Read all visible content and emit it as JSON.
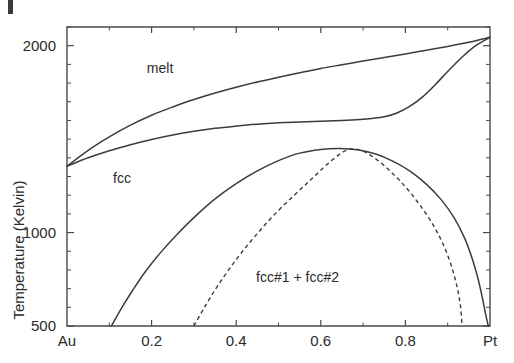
{
  "figure": {
    "kind": "binary-alloy-phase-diagram",
    "background_color": "#ffffff",
    "line_color": "#3c3c3c",
    "axis_color": "#4a4a4a",
    "corner_mark": "artifact-mark"
  },
  "chart_data": {
    "type": "line",
    "title": "",
    "xlabel": "",
    "ylabel": "Temperature (Kelvin)",
    "xlim": [
      0,
      1
    ],
    "ylim": [
      500,
      2100
    ],
    "grid": false,
    "legend": "none",
    "x_endpoint_labels": {
      "left": "Au",
      "right": "Pt"
    },
    "xticks": [
      0,
      0.2,
      0.4,
      0.6,
      0.8,
      1.0
    ],
    "xticklabels": [
      "Au",
      "0.2",
      "0.4",
      "0.6",
      "0.8",
      "Pt"
    ],
    "xticks_minor": [
      0.1,
      0.3,
      0.5,
      0.7,
      0.9
    ],
    "yticks": [
      500,
      1000,
      2000
    ],
    "yticklabels": [
      "500",
      "1000",
      "2000"
    ],
    "yticks_minor": [
      600,
      700,
      800,
      900,
      1100,
      1200,
      1300,
      1400,
      1500,
      1600,
      1700,
      1800,
      1900,
      2100
    ],
    "annotations": [
      {
        "text": "melt",
        "x": 0.22,
        "y": 1880
      },
      {
        "text": "fcc",
        "x": 0.13,
        "y": 1290
      },
      {
        "text": "fcc#1 + fcc#2",
        "x": 0.545,
        "y": 760
      }
    ],
    "series": [
      {
        "name": "liquidus",
        "style": "solid",
        "points": [
          [
            0.0,
            1355
          ],
          [
            0.05,
            1440
          ],
          [
            0.1,
            1512
          ],
          [
            0.15,
            1575
          ],
          [
            0.2,
            1628
          ],
          [
            0.25,
            1672
          ],
          [
            0.3,
            1712
          ],
          [
            0.35,
            1747
          ],
          [
            0.4,
            1778
          ],
          [
            0.45,
            1806
          ],
          [
            0.5,
            1831
          ],
          [
            0.55,
            1855
          ],
          [
            0.6,
            1878
          ],
          [
            0.65,
            1898
          ],
          [
            0.7,
            1918
          ],
          [
            0.75,
            1937
          ],
          [
            0.8,
            1956
          ],
          [
            0.85,
            1976
          ],
          [
            0.9,
            1996
          ],
          [
            0.95,
            2018
          ],
          [
            1.0,
            2045
          ]
        ]
      },
      {
        "name": "solidus",
        "style": "solid",
        "points": [
          [
            0.0,
            1355
          ],
          [
            0.05,
            1400
          ],
          [
            0.1,
            1438
          ],
          [
            0.15,
            1470
          ],
          [
            0.2,
            1498
          ],
          [
            0.25,
            1522
          ],
          [
            0.3,
            1542
          ],
          [
            0.35,
            1558
          ],
          [
            0.4,
            1570
          ],
          [
            0.45,
            1580
          ],
          [
            0.5,
            1587
          ],
          [
            0.55,
            1592
          ],
          [
            0.6,
            1596
          ],
          [
            0.65,
            1600
          ],
          [
            0.7,
            1606
          ],
          [
            0.75,
            1620
          ],
          [
            0.78,
            1640
          ],
          [
            0.81,
            1675
          ],
          [
            0.84,
            1725
          ],
          [
            0.87,
            1790
          ],
          [
            0.9,
            1862
          ],
          [
            0.93,
            1930
          ],
          [
            0.96,
            1990
          ],
          [
            1.0,
            2045
          ]
        ]
      },
      {
        "name": "binodal-miscibility-gap",
        "style": "solid",
        "points": [
          [
            0.105,
            500
          ],
          [
            0.13,
            600
          ],
          [
            0.155,
            690
          ],
          [
            0.185,
            790
          ],
          [
            0.22,
            890
          ],
          [
            0.26,
            990
          ],
          [
            0.3,
            1080
          ],
          [
            0.35,
            1180
          ],
          [
            0.4,
            1262
          ],
          [
            0.45,
            1330
          ],
          [
            0.5,
            1385
          ],
          [
            0.55,
            1425
          ],
          [
            0.6,
            1445
          ],
          [
            0.645,
            1450
          ],
          [
            0.69,
            1442
          ],
          [
            0.73,
            1420
          ],
          [
            0.77,
            1382
          ],
          [
            0.81,
            1330
          ],
          [
            0.85,
            1258
          ],
          [
            0.885,
            1175
          ],
          [
            0.915,
            1080
          ],
          [
            0.94,
            970
          ],
          [
            0.958,
            860
          ],
          [
            0.972,
            750
          ],
          [
            0.982,
            650
          ],
          [
            0.99,
            560
          ],
          [
            0.996,
            500
          ]
        ]
      },
      {
        "name": "spinodal",
        "style": "dashed",
        "points": [
          [
            0.3,
            500
          ],
          [
            0.325,
            600
          ],
          [
            0.352,
            700
          ],
          [
            0.382,
            800
          ],
          [
            0.415,
            900
          ],
          [
            0.452,
            1000
          ],
          [
            0.492,
            1100
          ],
          [
            0.535,
            1195
          ],
          [
            0.575,
            1280
          ],
          [
            0.61,
            1355
          ],
          [
            0.64,
            1412
          ],
          [
            0.66,
            1440
          ],
          [
            0.675,
            1448
          ],
          [
            0.695,
            1440
          ],
          [
            0.72,
            1410
          ],
          [
            0.75,
            1358
          ],
          [
            0.785,
            1282
          ],
          [
            0.82,
            1190
          ],
          [
            0.852,
            1090
          ],
          [
            0.878,
            990
          ],
          [
            0.898,
            890
          ],
          [
            0.913,
            790
          ],
          [
            0.923,
            700
          ],
          [
            0.93,
            610
          ],
          [
            0.934,
            500
          ]
        ]
      }
    ]
  }
}
